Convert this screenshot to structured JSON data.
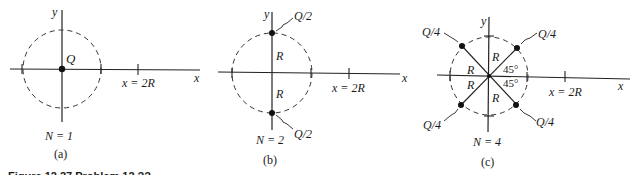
{
  "figure": {
    "caption_partial": "Figure 12.27    Problem 12.??",
    "panels": [
      {
        "id": "a",
        "label": "(a)",
        "n_label": "N = 1",
        "axis_x": "x",
        "axis_y": "y",
        "tick_label": "x = 2R",
        "charges": [
          {
            "label": "Q",
            "position": "origin"
          }
        ]
      },
      {
        "id": "b",
        "label": "(b)",
        "n_label": "N = 2",
        "axis_x": "x",
        "axis_y": "y",
        "tick_label": "x = 2R",
        "radius_labels": [
          "R",
          "R"
        ],
        "charges": [
          {
            "label": "Q/2",
            "position": "top"
          },
          {
            "label": "Q/2",
            "position": "bottom"
          }
        ]
      },
      {
        "id": "c",
        "label": "(c)",
        "n_label": "N = 4",
        "axis_x": "x",
        "axis_y": "y",
        "tick_label": "x = 2R",
        "radius_labels": [
          "R",
          "R",
          "R",
          "R"
        ],
        "angle_labels": [
          "45°",
          "45°"
        ],
        "charges": [
          {
            "label": "Q/4",
            "position": "upper-left"
          },
          {
            "label": "Q/4",
            "position": "upper-right"
          },
          {
            "label": "Q/4",
            "position": "lower-left"
          },
          {
            "label": "Q/4",
            "position": "lower-right"
          }
        ]
      }
    ]
  },
  "colors": {
    "ink": "#1a1a1a",
    "background": "#ffffff"
  }
}
